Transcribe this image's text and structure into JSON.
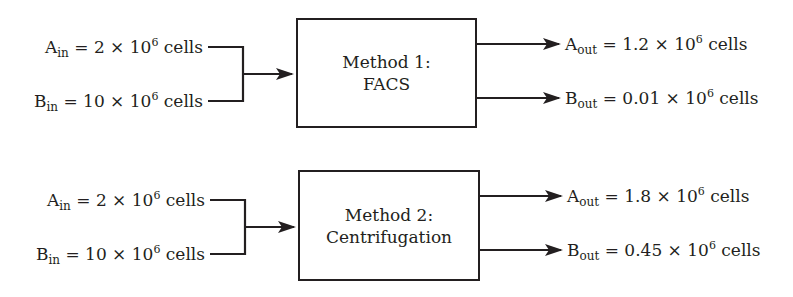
{
  "diagram": {
    "type": "flow",
    "methods": [
      {
        "title_line1": "Method 1:",
        "title_line2": "FACS",
        "inputs": [
          {
            "var": "A",
            "sub": "in",
            "coef": "2",
            "exp": "6",
            "unit": "cells"
          },
          {
            "var": "B",
            "sub": "in",
            "coef": "10",
            "exp": "6",
            "unit": "cells"
          }
        ],
        "outputs": [
          {
            "var": "A",
            "sub": "out",
            "coef": "1.2",
            "exp": "6",
            "unit": "cells"
          },
          {
            "var": "B",
            "sub": "out",
            "coef": "0.01",
            "exp": "6",
            "unit": "cells"
          }
        ]
      },
      {
        "title_line1": "Method 2:",
        "title_line2": "Centrifugation",
        "inputs": [
          {
            "var": "A",
            "sub": "in",
            "coef": "2",
            "exp": "6",
            "unit": "cells"
          },
          {
            "var": "B",
            "sub": "in",
            "coef": "10",
            "exp": "6",
            "unit": "cells"
          }
        ],
        "outputs": [
          {
            "var": "A",
            "sub": "out",
            "coef": "1.8",
            "exp": "6",
            "unit": "cells"
          },
          {
            "var": "B",
            "sub": "out",
            "coef": "0.45",
            "exp": "6",
            "unit": "cells"
          }
        ]
      }
    ],
    "symbols": {
      "equals": " = ",
      "times": " × 10"
    },
    "colors": {
      "ink": "#231f20",
      "background": "#ffffff"
    }
  }
}
